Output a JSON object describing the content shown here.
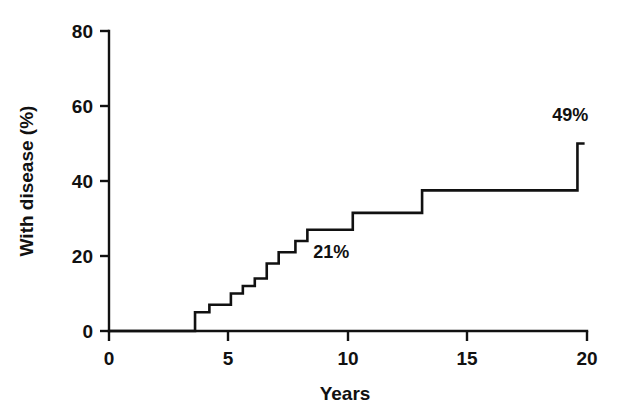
{
  "chart_data": {
    "type": "line",
    "subtype": "kaplan-meier-step",
    "title": "",
    "xlabel": "Years",
    "ylabel": "With disease (%)",
    "xlim": [
      0,
      20
    ],
    "ylim": [
      0,
      80
    ],
    "xticks": [
      0,
      5,
      10,
      15,
      20
    ],
    "xtick_labels": [
      "0",
      "5",
      "10",
      "15",
      "20"
    ],
    "yticks": [
      0,
      20,
      40,
      60,
      80
    ],
    "ytick_labels": [
      "0",
      "20",
      "40",
      "60",
      "80"
    ],
    "grid": false,
    "legend": false,
    "legend_position": "none",
    "line_color": "#111111",
    "background_color": "#ffffff",
    "series": [
      {
        "name": "Cumulative incidence of disease",
        "x": [
          0,
          3.6,
          4.2,
          5.1,
          5.6,
          6.1,
          6.6,
          7.1,
          7.8,
          8.3,
          10.2,
          13.1,
          19.6,
          19.9
        ],
        "values": [
          0,
          5,
          7,
          10,
          12,
          14,
          18,
          21,
          24,
          27,
          31.5,
          37.5,
          50,
          50
        ]
      }
    ],
    "annotations": [
      {
        "text": "21%",
        "x": 9.3,
        "y": 19.5
      },
      {
        "text": "49%",
        "x": 19.3,
        "y": 56
      }
    ]
  },
  "axes": {
    "y_title": "With disease (%)",
    "x_title": "Years",
    "y_tick_0": "0",
    "y_tick_1": "20",
    "y_tick_2": "40",
    "y_tick_3": "60",
    "y_tick_4": "80",
    "x_tick_0": "0",
    "x_tick_1": "5",
    "x_tick_2": "10",
    "x_tick_3": "15",
    "x_tick_4": "20"
  },
  "labels": {
    "annotation_mid": "21%",
    "annotation_end": "49%"
  }
}
